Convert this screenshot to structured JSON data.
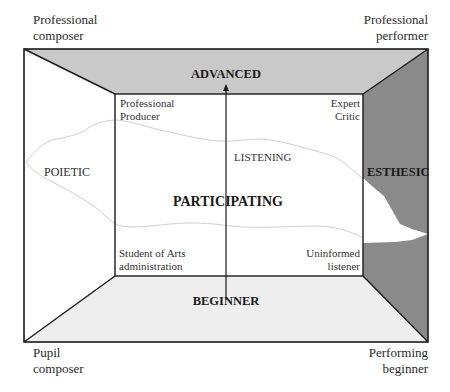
{
  "corners": {
    "top_left": [
      "Professional",
      "composer"
    ],
    "top_right": [
      "Professional",
      "performer"
    ],
    "bottom_left": [
      "Pupil",
      "composer"
    ],
    "bottom_right": [
      "Performing",
      "beginner"
    ]
  },
  "inner_corners": {
    "top_left": [
      "Professional",
      "Producer"
    ],
    "top_right": [
      "Expert",
      "Critic"
    ],
    "bottom_left": [
      "Student of Arts",
      "administration"
    ],
    "bottom_right": [
      "Uninformed",
      "listener"
    ]
  },
  "axis": {
    "top": "ADVANCED",
    "bottom": "BEGINNER"
  },
  "regions": {
    "left": "POIETIC",
    "right": "ESTHESIC",
    "center": "PARTICIPATING",
    "band": "LISTENING"
  },
  "colors": {
    "top_panel": "#c9c9c9",
    "right_panel": "#8a8a8a",
    "bottom_panel": "#eeeeee",
    "left_panel": "#ffffff",
    "cloud_outline": "#cfcfcf",
    "lines": "#1a1a1a"
  }
}
